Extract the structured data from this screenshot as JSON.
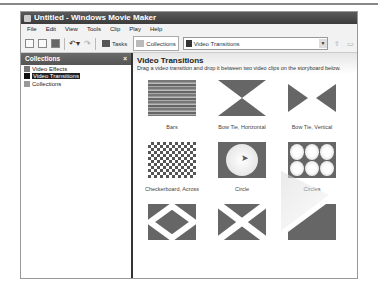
{
  "window": {
    "title": "Untitled - Windows Movie Maker"
  },
  "menu": [
    "File",
    "Edit",
    "View",
    "Tools",
    "Clip",
    "Play",
    "Help"
  ],
  "toolbar": {
    "tasks_label": "Tasks",
    "collections_label": "Collections",
    "dropdown_value": "Video Transitions"
  },
  "sidebar": {
    "title": "Collections",
    "close": "×",
    "items": [
      {
        "label": "Video Effects",
        "selected": false
      },
      {
        "label": "Video Transitions",
        "selected": true
      },
      {
        "label": "Collections",
        "selected": false
      }
    ]
  },
  "main": {
    "title": "Video Transitions",
    "description": "Drag a video transition and drop it between two video clips on the storyboard below.",
    "items": [
      {
        "label": "Bars"
      },
      {
        "label": "Bow Tie, Horizontal"
      },
      {
        "label": "Bow Tie, Vertical"
      },
      {
        "label": "Checkerboard, Across"
      },
      {
        "label": "Circle"
      },
      {
        "label": "Circles"
      },
      {
        "label": ""
      },
      {
        "label": ""
      },
      {
        "label": ""
      }
    ]
  }
}
